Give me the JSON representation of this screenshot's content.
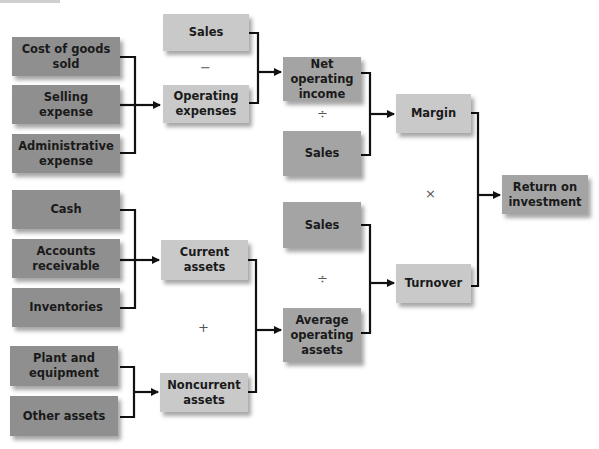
{
  "diagram": {
    "colors": {
      "input_box": "#8f8f8f",
      "intermediate_box": "#c9c9c9",
      "connector": "#111111"
    },
    "boxes": {
      "cogs": "Cost of goods sold",
      "selling": "Selling expense",
      "admin": "Administrative expense",
      "sales_top": "Sales",
      "opex": "Operating expenses",
      "noi": "Net operating income",
      "sales_margin": "Sales",
      "margin": "Margin",
      "roi": "Return on investment",
      "cash": "Cash",
      "ar": "Accounts receivable",
      "inventories": "Inventories",
      "plant": "Plant and equipment",
      "other": "Other assets",
      "current": "Current assets",
      "noncurrent": "Noncurrent assets",
      "sales_turnover": "Sales",
      "avg_assets": "Average operating assets",
      "turnover": "Turnover"
    },
    "operators": {
      "minus": "−",
      "divide_margin": "÷",
      "times": "×",
      "divide_turnover": "÷",
      "plus": "+"
    }
  }
}
